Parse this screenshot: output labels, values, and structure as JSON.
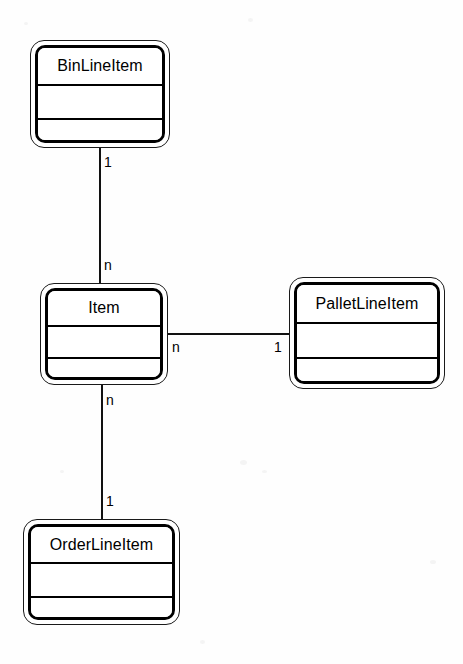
{
  "diagram": {
    "type": "uml-class-diagram",
    "title": "",
    "background_color": "#fefefe",
    "line_color": "#111111",
    "text_color": "#000000"
  },
  "classes": [
    {
      "id": "bin-line-item",
      "name": "BinLineItem",
      "x": 30,
      "y": 40,
      "width": 140,
      "height": 108,
      "title_height": 38,
      "attrs_height": 34,
      "attributes": [],
      "operations": []
    },
    {
      "id": "item",
      "name": "Item",
      "x": 40,
      "y": 283,
      "width": 128,
      "height": 102,
      "title_height": 36,
      "attrs_height": 32,
      "attributes": [],
      "operations": []
    },
    {
      "id": "pallet-line-item",
      "name": "PalletLineItem",
      "x": 289,
      "y": 277,
      "width": 156,
      "height": 112,
      "title_height": 39,
      "attrs_height": 35,
      "attributes": [],
      "operations": []
    },
    {
      "id": "order-line-item",
      "name": "OrderLineItem",
      "x": 23,
      "y": 519,
      "width": 157,
      "height": 106,
      "title_height": 37,
      "attrs_height": 34,
      "attributes": [],
      "operations": []
    }
  ],
  "associations": [
    {
      "id": "bin-to-item",
      "orientation": "vertical",
      "from": "bin-line-item",
      "to": "item",
      "x": 99,
      "y1": 148,
      "y2": 283,
      "source_multiplicity": "1",
      "target_multiplicity": "n",
      "source_label_x": 104,
      "source_label_y": 155,
      "target_label_x": 104,
      "target_label_y": 258
    },
    {
      "id": "item-to-pallet",
      "orientation": "horizontal",
      "from": "item",
      "to": "pallet-line-item",
      "y": 333,
      "x1": 168,
      "x2": 289,
      "source_multiplicity": "n",
      "target_multiplicity": "1",
      "source_label_x": 172,
      "source_label_y": 340,
      "target_label_x": 274,
      "target_label_y": 340
    },
    {
      "id": "item-to-order",
      "orientation": "vertical",
      "from": "item",
      "to": "order-line-item",
      "x": 101,
      "y1": 385,
      "y2": 519,
      "source_multiplicity": "n",
      "target_multiplicity": "1",
      "source_label_x": 106,
      "source_label_y": 393,
      "target_label_x": 106,
      "target_label_y": 494
    }
  ]
}
